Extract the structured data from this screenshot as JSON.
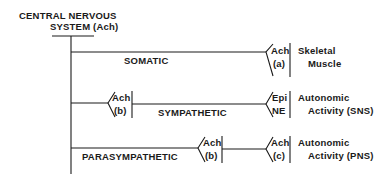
{
  "title": {
    "line1": "CENTRAL NERVOUS",
    "line2": "SYSTEM (Ach)"
  },
  "branches": [
    {
      "name": "SOMATIC",
      "effector_transmitter": "Ach",
      "effector_receptor": "(a)",
      "target_line1": "Skeletal",
      "target_line2": "Muscle"
    },
    {
      "name": "SYMPATHETIC",
      "ganglion_transmitter": "Ach",
      "ganglion_receptor": "(b)",
      "effector_transmitter": "Epi",
      "effector_receptor": "NE",
      "target_line1": "Autonomic",
      "target_line2": "Activity (SNS)"
    },
    {
      "name": "PARASYMPATHETIC",
      "ganglion_transmitter": "Ach",
      "ganglion_receptor": "(b)",
      "effector_transmitter": "Ach",
      "effector_receptor": "(c)",
      "target_line1": "Autonomic",
      "target_line2": "Activity (PNS)"
    }
  ],
  "colors": {
    "ink": "#1a1a1a",
    "background": "#ffffff"
  }
}
